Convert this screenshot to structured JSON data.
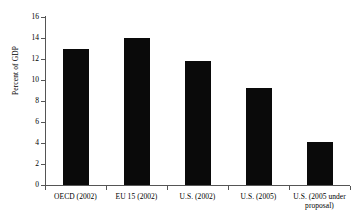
{
  "chart_data": {
    "type": "bar",
    "title": "",
    "xlabel": "",
    "ylabel": "Percent of GDP",
    "categories": [
      "OECD (2002)",
      "EU 15 (2002)",
      "U.S. (2002)",
      "U.S. (2005)",
      "U.S. (2005 under proposal)"
    ],
    "values": [
      13.0,
      14.0,
      11.8,
      9.2,
      4.1
    ],
    "ylim": [
      0,
      16
    ],
    "yticks": [
      0,
      2,
      4,
      6,
      8,
      10,
      12,
      14,
      16
    ],
    "ytick_labels": [
      "0",
      "2",
      "4",
      "6",
      "8",
      "10",
      "12",
      "14",
      "16"
    ],
    "grid": false,
    "legend": null,
    "bar_color": "#0a0a0a",
    "background_color": "#ffffff",
    "axis_color": "#555555"
  },
  "axis": {
    "y_title": "Percent of GDP"
  },
  "x_labels": [
    {
      "line1": "OECD (2002)",
      "line2": ""
    },
    {
      "line1": "EU 15 (2002)",
      "line2": ""
    },
    {
      "line1": "U.S. (2002)",
      "line2": ""
    },
    {
      "line1": "U.S. (2005)",
      "line2": ""
    },
    {
      "line1": "U.S. (2005 under",
      "line2": "proposal)"
    }
  ]
}
